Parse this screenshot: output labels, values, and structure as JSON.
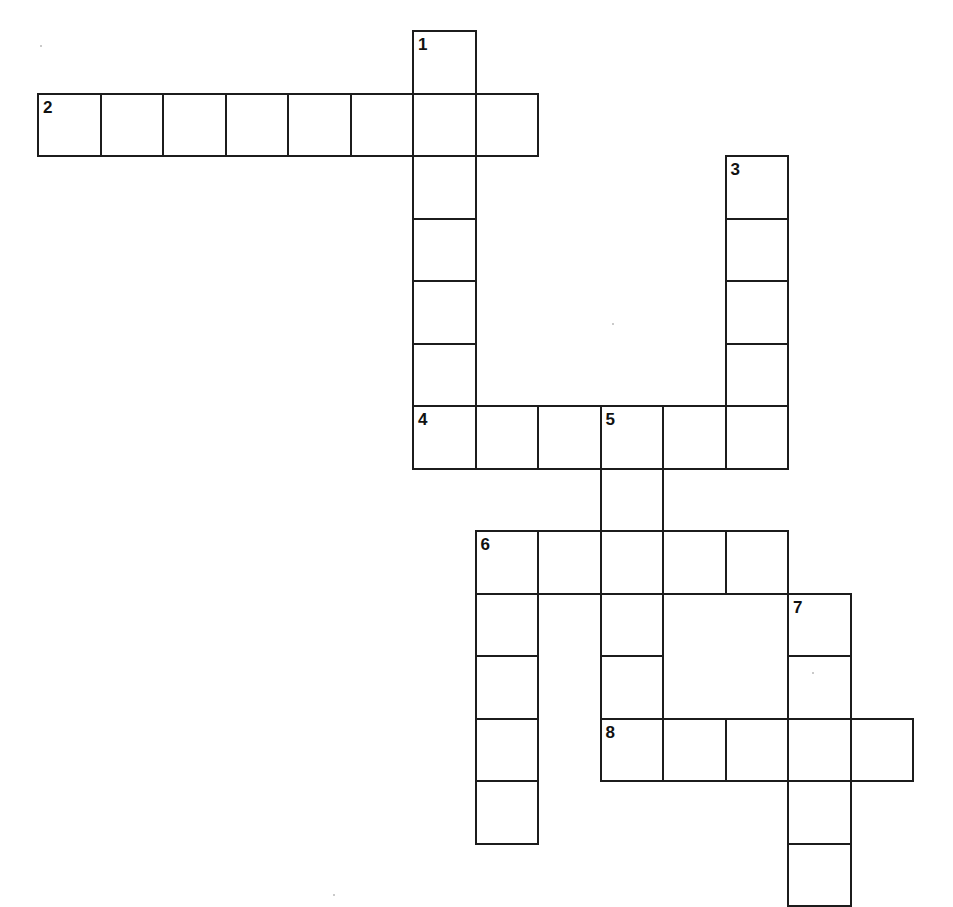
{
  "puzzle": {
    "title": "Crossword Puzzle Grid",
    "cell_size": 62.5,
    "origin_x": 37,
    "origin_y": 30,
    "cell_fill": "#ffffff",
    "cell_border_color": "#1c1c1c",
    "cell_border_width": 2,
    "number_color": "#111111",
    "background": "#ffffff",
    "clue_count": 8,
    "entries": [
      {
        "number": "1",
        "direction": "down",
        "col": 6,
        "row": 0,
        "length": 7,
        "label": "1-down"
      },
      {
        "number": "2",
        "direction": "across",
        "col": 0,
        "row": 1,
        "length": 8,
        "label": "2-across"
      },
      {
        "number": "3",
        "direction": "down",
        "col": 11,
        "row": 2,
        "length": 5,
        "label": "3-down"
      },
      {
        "number": "4",
        "direction": "across",
        "col": 6,
        "row": 6,
        "length": 6,
        "label": "4-across"
      },
      {
        "number": "5",
        "direction": "down",
        "col": 9,
        "row": 6,
        "length": 6,
        "label": "5-down"
      },
      {
        "number": "6",
        "direction": "both",
        "col": 7,
        "row": 8,
        "length_across": 5,
        "length_down": 5,
        "label": "6-across-and-down"
      },
      {
        "number": "7",
        "direction": "down",
        "col": 12,
        "row": 9,
        "length": 5,
        "label": "7-down"
      },
      {
        "number": "8",
        "direction": "across",
        "col": 9,
        "row": 11,
        "length": 5,
        "label": "8-across"
      }
    ],
    "cells": [
      {
        "col": 6,
        "row": 0,
        "number": "1"
      },
      {
        "col": 0,
        "row": 1,
        "number": "2"
      },
      {
        "col": 1,
        "row": 1,
        "number": ""
      },
      {
        "col": 2,
        "row": 1,
        "number": ""
      },
      {
        "col": 3,
        "row": 1,
        "number": ""
      },
      {
        "col": 4,
        "row": 1,
        "number": ""
      },
      {
        "col": 5,
        "row": 1,
        "number": ""
      },
      {
        "col": 6,
        "row": 1,
        "number": ""
      },
      {
        "col": 7,
        "row": 1,
        "number": ""
      },
      {
        "col": 6,
        "row": 2,
        "number": ""
      },
      {
        "col": 11,
        "row": 2,
        "number": "3"
      },
      {
        "col": 6,
        "row": 3,
        "number": ""
      },
      {
        "col": 11,
        "row": 3,
        "number": ""
      },
      {
        "col": 6,
        "row": 4,
        "number": ""
      },
      {
        "col": 11,
        "row": 4,
        "number": ""
      },
      {
        "col": 6,
        "row": 5,
        "number": ""
      },
      {
        "col": 11,
        "row": 5,
        "number": ""
      },
      {
        "col": 6,
        "row": 6,
        "number": "4"
      },
      {
        "col": 7,
        "row": 6,
        "number": ""
      },
      {
        "col": 8,
        "row": 6,
        "number": ""
      },
      {
        "col": 9,
        "row": 6,
        "number": "5"
      },
      {
        "col": 10,
        "row": 6,
        "number": ""
      },
      {
        "col": 11,
        "row": 6,
        "number": ""
      },
      {
        "col": 9,
        "row": 7,
        "number": ""
      },
      {
        "col": 7,
        "row": 8,
        "number": "6"
      },
      {
        "col": 8,
        "row": 8,
        "number": ""
      },
      {
        "col": 9,
        "row": 8,
        "number": ""
      },
      {
        "col": 10,
        "row": 8,
        "number": ""
      },
      {
        "col": 11,
        "row": 8,
        "number": ""
      },
      {
        "col": 7,
        "row": 9,
        "number": ""
      },
      {
        "col": 9,
        "row": 9,
        "number": ""
      },
      {
        "col": 12,
        "row": 9,
        "number": "7"
      },
      {
        "col": 7,
        "row": 10,
        "number": ""
      },
      {
        "col": 9,
        "row": 10,
        "number": ""
      },
      {
        "col": 12,
        "row": 10,
        "number": ""
      },
      {
        "col": 7,
        "row": 11,
        "number": ""
      },
      {
        "col": 9,
        "row": 11,
        "number": "8"
      },
      {
        "col": 10,
        "row": 11,
        "number": ""
      },
      {
        "col": 11,
        "row": 11,
        "number": ""
      },
      {
        "col": 12,
        "row": 11,
        "number": ""
      },
      {
        "col": 13,
        "row": 11,
        "number": ""
      },
      {
        "col": 7,
        "row": 12,
        "number": ""
      },
      {
        "col": 12,
        "row": 12,
        "number": ""
      },
      {
        "col": 12,
        "row": 13,
        "number": ""
      }
    ],
    "specks": [
      {
        "x": 40,
        "y": 45
      },
      {
        "x": 333,
        "y": 894
      },
      {
        "x": 612,
        "y": 323
      },
      {
        "x": 812,
        "y": 672
      }
    ]
  }
}
